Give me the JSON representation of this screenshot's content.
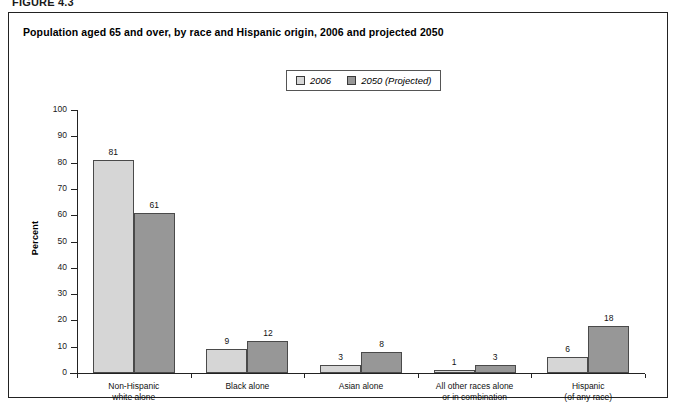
{
  "figure": {
    "label": "FIGURE 4.3"
  },
  "chart_title": "Population aged 65 and over, by race and Hispanic origin, 2006 and projected 2050",
  "legend": {
    "entries": [
      {
        "label": "2006",
        "color": "#d6d6d6"
      },
      {
        "label": "2050 (Projected)",
        "color": "#979797"
      }
    ]
  },
  "axis": {
    "y_title": "Percent",
    "y_ticks": [
      "0",
      "10",
      "20",
      "30",
      "40",
      "50",
      "60",
      "70",
      "80",
      "90",
      "100"
    ]
  },
  "chart_data": {
    "type": "bar",
    "title": "Population aged 65 and over, by race and Hispanic origin, 2006 and projected 2050",
    "xlabel": "",
    "ylabel": "Percent",
    "ylim": [
      0,
      100
    ],
    "grid": false,
    "legend_position": "top-center",
    "categories": [
      "Non-Hispanic\nwhite alone",
      "Black alone",
      "Asian alone",
      "All other races alone\nor in combination",
      "Hispanic\n(of any race)"
    ],
    "category_lines": [
      [
        "Non-Hispanic",
        "white alone"
      ],
      [
        "Black alone",
        ""
      ],
      [
        "Asian alone",
        ""
      ],
      [
        "All other races alone",
        "or in combination"
      ],
      [
        "Hispanic",
        "(of any race)"
      ]
    ],
    "series": [
      {
        "name": "2006",
        "color": "#d6d6d6",
        "values": [
          81,
          9,
          3,
          1,
          6
        ]
      },
      {
        "name": "2050 (Projected)",
        "color": "#979797",
        "values": [
          61,
          12,
          8,
          3,
          18
        ]
      }
    ]
  }
}
